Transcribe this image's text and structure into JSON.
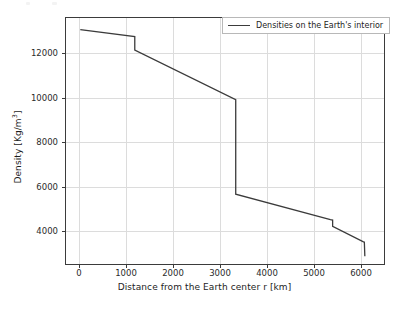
{
  "chart_data": {
    "type": "line",
    "title": "",
    "xlabel": "Distance from the Earth center r [km]",
    "ylabel": "Density [Kg/m³]",
    "ylabel_base": "Density [Kg/m",
    "ylabel_exp": "3",
    "ylabel_tail": "]",
    "legend": [
      "Densities on the Earth's interior"
    ],
    "legend_position": "upper right",
    "grid": true,
    "xlim": [
      -320,
      6800
    ],
    "ylim": [
      2500,
      13600
    ],
    "xticks": [
      0,
      1000,
      2000,
      3000,
      4000,
      5000,
      6000
    ],
    "xtick_labels": [
      "0",
      "1000",
      "2000",
      "3000",
      "4000",
      "5000",
      "6000"
    ],
    "yticks": [
      4000,
      6000,
      8000,
      10000,
      12000
    ],
    "ytick_labels": [
      "4000",
      "6000",
      "8000",
      "10000",
      "12000"
    ],
    "line_color": "#3b3b3b",
    "grid_color": "#dcdcdc",
    "background": "#ffffff",
    "series": [
      {
        "name": "Densities on the Earth's interior",
        "x": [
          0,
          1220,
          1220,
          3480,
          3480,
          5600,
          5650,
          5650,
          6340,
          6360,
          6371
        ],
        "y": [
          13080,
          12760,
          12150,
          9920,
          5650,
          4500,
          4480,
          4200,
          3500,
          3490,
          2850
        ]
      }
    ],
    "annotations": {
      "inner_core_boundary_km": 1220,
      "core_mantle_boundary_km": 3480,
      "upper_mantle_step_km": 5650,
      "surface_km": 6371
    }
  },
  "axes": {
    "x_tick_px": [
      79,
      126,
      173,
      220,
      267,
      314,
      361
    ],
    "y_tick_px": [
      231,
      187,
      142,
      98,
      53
    ]
  }
}
